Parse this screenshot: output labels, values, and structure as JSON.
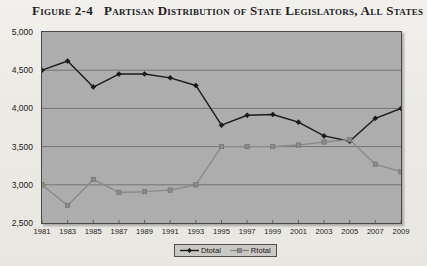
{
  "figure": {
    "label": "Figure 2-4",
    "title": "Partisan Distribution of State Legislators, All States"
  },
  "colors": {
    "plot_background": "#adadad",
    "page_background": "#efeee9",
    "frame": "#4a4a4a",
    "gridline": "#6e6e6e",
    "dtotal": "#1a1a1a",
    "rtotal": "#8a8a8a",
    "legend_background": "#c9c8c4"
  },
  "legend": {
    "position": "bottom-center",
    "entries": [
      {
        "name": "Dtotal",
        "marker": "diamond",
        "color": "#1a1a1a"
      },
      {
        "name": "Rtotal",
        "marker": "square",
        "color": "#8a8a8a"
      }
    ]
  },
  "axes": {
    "y_ticks": [
      "2,500",
      "3,000",
      "3,500",
      "4,000",
      "4,500",
      "5,000"
    ],
    "x_ticks": [
      "1981",
      "1983",
      "1985",
      "1987",
      "1989",
      "1991",
      "1993",
      "1995",
      "1997",
      "1999",
      "2001",
      "2003",
      "2005",
      "2007",
      "2009"
    ]
  },
  "chart_data": {
    "type": "line",
    "title": "Partisan Distribution of State Legislators, All States",
    "xlabel": "",
    "ylabel": "",
    "ylim": [
      2500,
      5000
    ],
    "ytick_step": 500,
    "grid": true,
    "legend_position": "bottom-center",
    "categories": [
      1981,
      1983,
      1985,
      1987,
      1989,
      1991,
      1993,
      1995,
      1997,
      1999,
      2001,
      2003,
      2005,
      2007,
      2009
    ],
    "series": [
      {
        "name": "Dtotal",
        "marker": "diamond",
        "color": "#1a1a1a",
        "values": [
          4500,
          4620,
          4280,
          4450,
          4450,
          4400,
          4300,
          3780,
          3910,
          3920,
          3820,
          3640,
          3570,
          3870,
          4000
        ]
      },
      {
        "name": "Rtotal",
        "marker": "square",
        "color": "#8a8a8a",
        "values": [
          3000,
          2730,
          3070,
          2900,
          2910,
          2930,
          3000,
          3500,
          3500,
          3500,
          3520,
          3560,
          3590,
          3270,
          3170
        ]
      }
    ]
  }
}
